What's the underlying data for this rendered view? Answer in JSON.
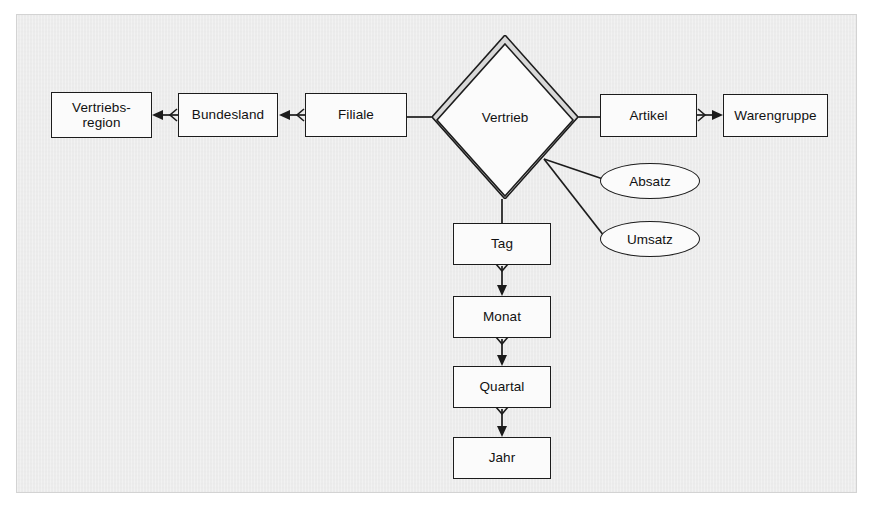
{
  "diagram": {
    "background_color": "#ededed",
    "line_color": "#1c1c1c",
    "shape_fill": "#fbfbfb"
  },
  "entities": [
    {
      "id": "vertriebsregion",
      "label_line1": "Vertriebs-",
      "label_line2": "region",
      "x": 51,
      "y": 92,
      "w": 101,
      "h": 46
    },
    {
      "id": "bundesland",
      "label_line1": "Bundesland",
      "label_line2": "",
      "x": 178,
      "y": 93,
      "w": 100,
      "h": 44
    },
    {
      "id": "filiale",
      "label_line1": "Filiale",
      "label_line2": "",
      "x": 305,
      "y": 93,
      "w": 102,
      "h": 44
    },
    {
      "id": "artikel",
      "label_line1": "Artikel",
      "label_line2": "",
      "x": 600,
      "y": 94,
      "w": 97,
      "h": 43
    },
    {
      "id": "warengruppe",
      "label_line1": "Warengruppe",
      "label_line2": "",
      "x": 723,
      "y": 94,
      "w": 105,
      "h": 43
    },
    {
      "id": "tag",
      "label_line1": "Tag",
      "label_line2": "",
      "x": 453,
      "y": 223,
      "w": 98,
      "h": 42
    },
    {
      "id": "monat",
      "label_line1": "Monat",
      "label_line2": "",
      "x": 453,
      "y": 296,
      "w": 98,
      "h": 42
    },
    {
      "id": "quartal",
      "label_line1": "Quartal",
      "label_line2": "",
      "x": 453,
      "y": 366,
      "w": 98,
      "h": 42
    },
    {
      "id": "jahr",
      "label_line1": "Jahr",
      "label_line2": "",
      "x": 453,
      "y": 437,
      "w": 98,
      "h": 42
    }
  ],
  "relationship": {
    "id": "vertrieb",
    "label": "Vertrieb",
    "center_x": 505,
    "center_y": 117,
    "half_width": 73,
    "half_height": 82,
    "double_outline": true
  },
  "attributes": [
    {
      "id": "absatz",
      "label": "Absatz",
      "x": 600,
      "y": 163,
      "w": 100,
      "h": 36
    },
    {
      "id": "umsatz",
      "label": "Umsatz",
      "x": 600,
      "y": 221,
      "w": 100,
      "h": 36
    }
  ],
  "connections": [
    {
      "id": "bundesland-to-vertriebsregion",
      "from": "bundesland",
      "to": "vertriebsregion",
      "source_marker": "crowsfoot",
      "target_marker": "arrow",
      "direction": "left"
    },
    {
      "id": "filiale-to-bundesland",
      "from": "filiale",
      "to": "bundesland",
      "source_marker": "crowsfoot",
      "target_marker": "arrow",
      "direction": "left"
    },
    {
      "id": "vertrieb-to-filiale",
      "from": "vertrieb",
      "to": "filiale",
      "source_marker": "none",
      "target_marker": "none",
      "direction": "left"
    },
    {
      "id": "vertrieb-to-artikel",
      "from": "vertrieb",
      "to": "artikel",
      "source_marker": "none",
      "target_marker": "none",
      "direction": "right"
    },
    {
      "id": "artikel-to-warengruppe",
      "from": "artikel",
      "to": "warengruppe",
      "source_marker": "crowsfoot",
      "target_marker": "arrow",
      "direction": "right"
    },
    {
      "id": "vertrieb-to-tag",
      "from": "vertrieb",
      "to": "tag",
      "source_marker": "none",
      "target_marker": "none",
      "direction": "down"
    },
    {
      "id": "tag-to-monat",
      "from": "tag",
      "to": "monat",
      "source_marker": "crowsfoot",
      "target_marker": "arrow",
      "direction": "down"
    },
    {
      "id": "monat-to-quartal",
      "from": "monat",
      "to": "quartal",
      "source_marker": "crowsfoot",
      "target_marker": "arrow",
      "direction": "down"
    },
    {
      "id": "quartal-to-jahr",
      "from": "quartal",
      "to": "jahr",
      "source_marker": "crowsfoot",
      "target_marker": "arrow",
      "direction": "down"
    },
    {
      "id": "vertrieb-to-absatz",
      "from": "vertrieb",
      "to": "absatz",
      "source_marker": "none",
      "target_marker": "none",
      "direction": "diagonal"
    },
    {
      "id": "vertrieb-to-umsatz",
      "from": "vertrieb",
      "to": "umsatz",
      "source_marker": "none",
      "target_marker": "none",
      "direction": "diagonal"
    }
  ]
}
